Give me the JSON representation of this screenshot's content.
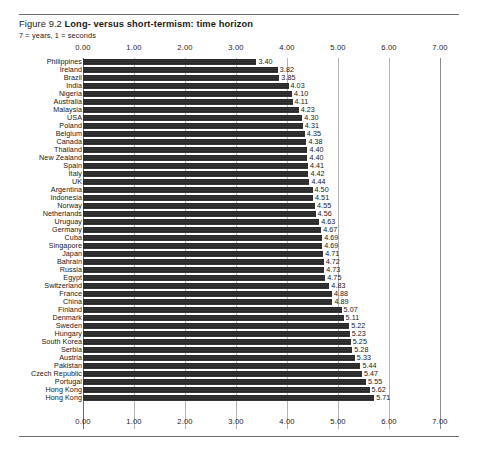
{
  "figure": {
    "number": "Figure 9.2",
    "title": "Long- versus short-termism: time horizon",
    "subtitle": "7 = years, 1 = seconds"
  },
  "chart_data": {
    "type": "bar",
    "orientation": "horizontal",
    "title": "Long- versus short-termism: time horizon",
    "subtitle": "7 = years, 1 = seconds",
    "xlabel": "",
    "ylabel": "",
    "xlim": [
      0,
      7
    ],
    "xticks": [
      "0.00",
      "1.00",
      "2.00",
      "3.00",
      "4.00",
      "5.00",
      "6.00",
      "7.00"
    ],
    "xtick_values": [
      0,
      1,
      2,
      3,
      4,
      5,
      6,
      7
    ],
    "xaxis_position": "both",
    "grid": true,
    "legend": "none",
    "bar_color": "#2d2d2d",
    "categories": [
      "Philippines",
      "Ireland",
      "Brazil",
      "India",
      "Nigeria",
      "Australia",
      "Malaysia",
      "USA",
      "Poland",
      "Belgium",
      "Canada",
      "Thailand",
      "New Zealand",
      "Spain",
      "Italy",
      "UK",
      "Argentina",
      "Indonesia",
      "Norway",
      "Netherlands",
      "Uruguay",
      "Germany",
      "Cuba",
      "Singapore",
      "Japan",
      "Bahrain",
      "Russia",
      "Egypt",
      "Switzerland",
      "France",
      "China",
      "Finland",
      "Denmark",
      "Sweden",
      "Hungary",
      "South Korea",
      "Serbia",
      "Austria",
      "Pakistan",
      "Czech Republic",
      "Portugal",
      "Hong Kong"
    ],
    "values": [
      3.4,
      3.82,
      3.85,
      4.03,
      4.1,
      4.11,
      4.23,
      4.3,
      4.31,
      4.35,
      4.38,
      4.4,
      4.4,
      4.41,
      4.42,
      4.44,
      4.5,
      4.51,
      4.55,
      4.56,
      4.63,
      4.67,
      4.69,
      4.69,
      4.71,
      4.72,
      4.73,
      4.75,
      4.83,
      4.88,
      4.89,
      5.07,
      5.11,
      5.22,
      5.23,
      5.25,
      5.28,
      5.33,
      5.44,
      5.47,
      5.55,
      5.62
    ],
    "value_labels": [
      "3.40",
      "3.82",
      "3.85",
      "4.03",
      "4.10",
      "4.11",
      "4.23",
      "4.30",
      "4.31",
      "4.35",
      "4.38",
      "4.40",
      "4.40",
      "4.41",
      "4.42",
      "4.44",
      "4.50",
      "4.51",
      "4.55",
      "4.56",
      "4.63",
      "4.67",
      "4.69",
      "4.69",
      "4.71",
      "4.72",
      "4.73",
      "4.75",
      "4.83",
      "4.88",
      "4.89",
      "5.07",
      "5.11",
      "5.22",
      "5.23",
      "5.25",
      "5.28",
      "5.33",
      "5.44",
      "5.47",
      "5.55",
      "5.62"
    ]
  },
  "extra_row": {
    "label": "Hong Kong",
    "value": 5.71,
    "value_label": "5.71"
  }
}
